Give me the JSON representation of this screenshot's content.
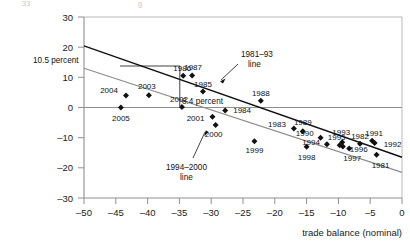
{
  "chart_data": {
    "type": "scatter",
    "title": "",
    "xlabel": "trade balance (nominal)",
    "ylabel": "",
    "xlim": [
      -50,
      0
    ],
    "ylim": [
      -30,
      30
    ],
    "xticks": [
      -50,
      -45,
      -40,
      -35,
      -30,
      -25,
      -20,
      -15,
      -10,
      -5,
      0
    ],
    "xtick_labels": [
      "–50",
      "–45",
      "–40",
      "–35",
      "–30",
      "–25",
      "–20",
      "–15",
      "–10",
      "–5",
      "0"
    ],
    "yticks": [
      30,
      20,
      10,
      0,
      -10,
      -20,
      -30
    ],
    "ytick_labels": [
      "30",
      "20",
      "10",
      "0",
      "–10",
      "–20",
      "–30"
    ],
    "grid": false,
    "legend": "none",
    "zero_line": true,
    "points": [
      {
        "label": "1981",
        "x": -4.0,
        "y": -15.7
      },
      {
        "label": "1982",
        "x": -6.6,
        "y": -12.0
      },
      {
        "label": "1983",
        "x": -17.0,
        "y": -7.0
      },
      {
        "label": "1984",
        "x": -27.8,
        "y": -1.0
      },
      {
        "label": "1985",
        "x": -31.3,
        "y": 5.3
      },
      {
        "label": "1986",
        "x": -34.4,
        "y": 10.5
      },
      {
        "label": "1987",
        "x": -33.0,
        "y": 10.6
      },
      {
        "label": "1988",
        "x": -22.2,
        "y": 2.2
      },
      {
        "label": "1989",
        "x": -15.6,
        "y": -7.9
      },
      {
        "label": "1990",
        "x": -12.8,
        "y": -10.0
      },
      {
        "label": "1991",
        "x": -4.7,
        "y": -11.0
      },
      {
        "label": "1992",
        "x": -4.3,
        "y": -11.8
      },
      {
        "label": "1993",
        "x": -9.4,
        "y": -11.5
      },
      {
        "label": "1994",
        "x": -11.8,
        "y": -12.2
      },
      {
        "label": "1995",
        "x": -9.8,
        "y": -12.5
      },
      {
        "label": "1996",
        "x": -9.3,
        "y": -12.9
      },
      {
        "label": "1997",
        "x": -8.3,
        "y": -13.6
      },
      {
        "label": "1998",
        "x": -15.0,
        "y": -13.0
      },
      {
        "label": "1999",
        "x": -23.2,
        "y": -11.2
      },
      {
        "label": "2000",
        "x": -29.3,
        "y": -5.8
      },
      {
        "label": "2001",
        "x": -29.8,
        "y": -3.1
      },
      {
        "label": "2002",
        "x": -34.6,
        "y": 0.2
      },
      {
        "label": "2003",
        "x": -39.8,
        "y": 4.1
      },
      {
        "label": "2004",
        "x": -43.4,
        "y": 4.0
      },
      {
        "label": "2005",
        "x": -44.2,
        "y": 0.0
      }
    ],
    "trend_lines": [
      {
        "name": "1981–93 line",
        "x1": -50,
        "y1": 20.4,
        "x2": 0,
        "y2": -16.5,
        "color": "#111111",
        "width": 1.4
      },
      {
        "name": "1994–2000 line",
        "x1": -50,
        "y1": 13.0,
        "x2": 0,
        "y2": -21.5,
        "color": "#8c8c8c",
        "width": 1.1
      }
    ],
    "annotations": [
      {
        "name": "pct-10-5",
        "text": "10.5 percent"
      },
      {
        "name": "pct-8-4",
        "text": "8.4 percent"
      },
      {
        "name": "line-1981-93",
        "text_1": "1981–93",
        "text_2": "line"
      },
      {
        "name": "line-1994-2000",
        "text_1": "1994–2000",
        "text_2": "line"
      }
    ]
  },
  "ghost_text": {
    "left": "33",
    "mid": "g"
  }
}
